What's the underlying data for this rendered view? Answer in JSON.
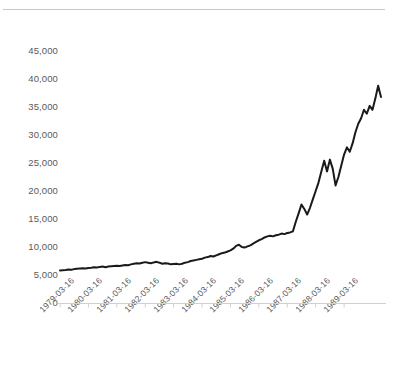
{
  "chart_data": {
    "type": "line",
    "title": "",
    "subtitle": "",
    "xlabel": "",
    "ylabel": "",
    "grid": false,
    "legend": false,
    "legend_position": "none",
    "line_color": "#1a1a1a",
    "axis_color": "#d0d0d0",
    "label_color": "#5a5a5a",
    "ylim": [
      0,
      45000
    ],
    "y_ticks": [
      "0",
      "5,000",
      "10,000",
      "15,000",
      "20,000",
      "25,000",
      "30,000",
      "35,000",
      "40,000",
      "45,000"
    ],
    "y_tick_values": [
      0,
      5000,
      10000,
      15000,
      20000,
      25000,
      30000,
      35000,
      40000,
      45000
    ],
    "x_ticks": [
      "1979-03-16",
      "1980-03-16",
      "1981-03-16",
      "1982-03-16",
      "1983-03-16",
      "1984-03-16",
      "1985-03-16",
      "1986-03-16",
      "1987-03-16",
      "1988-03-16",
      "1989-03-16"
    ],
    "xlim": [
      "1979-03-16",
      "1989-09-16"
    ],
    "series": [
      {
        "name": "series-1",
        "x": [
          0.0,
          0.1,
          0.2,
          0.3,
          0.4,
          0.5,
          0.6,
          0.7,
          0.8,
          0.9,
          1.0,
          1.1,
          1.2,
          1.3,
          1.4,
          1.5,
          1.6,
          1.7,
          1.8,
          1.9,
          2.0,
          2.1,
          2.2,
          2.3,
          2.4,
          2.5,
          2.6,
          2.7,
          2.8,
          2.9,
          3.0,
          3.1,
          3.2,
          3.3,
          3.4,
          3.5,
          3.6,
          3.7,
          3.8,
          3.9,
          4.0,
          4.1,
          4.2,
          4.3,
          4.4,
          4.5,
          4.6,
          4.7,
          4.8,
          4.9,
          5.0,
          5.1,
          5.2,
          5.3,
          5.4,
          5.5,
          5.6,
          5.7,
          5.8,
          5.9,
          6.0,
          6.1,
          6.2,
          6.3,
          6.4,
          6.5,
          6.6,
          6.7,
          6.8,
          6.9,
          7.0,
          7.1,
          7.2,
          7.3,
          7.4,
          7.5,
          7.6,
          7.7,
          7.8,
          7.9,
          8.0,
          8.1,
          8.2,
          8.3,
          8.4,
          8.5,
          8.6,
          8.7,
          8.8,
          8.9,
          9.0,
          9.1,
          9.2,
          9.3,
          9.4,
          9.5,
          9.6,
          9.7,
          9.8,
          9.9,
          10.0,
          10.1,
          10.2,
          10.3,
          10.4,
          10.5
        ],
        "values": [
          5800,
          5850,
          5900,
          6000,
          5950,
          6050,
          6100,
          6150,
          6200,
          6150,
          6250,
          6300,
          6400,
          6350,
          6450,
          6500,
          6400,
          6500,
          6550,
          6600,
          6650,
          6600,
          6700,
          6800,
          6750,
          6900,
          7000,
          7100,
          7050,
          7200,
          7300,
          7200,
          7100,
          7250,
          7350,
          7200,
          7000,
          7100,
          7050,
          6900,
          6950,
          7000,
          6900,
          7000,
          7200,
          7300,
          7500,
          7600,
          7700,
          7800,
          7900,
          8100,
          8200,
          8400,
          8300,
          8500,
          8700,
          8900,
          9000,
          9200,
          9400,
          9700,
          10200,
          10400,
          10000,
          9900,
          10100,
          10300,
          10600,
          10900,
          11200,
          11400,
          11700,
          11900,
          12000,
          11900,
          12100,
          12200,
          12400,
          12300,
          12500,
          12600,
          12800,
          14500,
          16000,
          17600,
          16800,
          15800,
          17000,
          18500,
          20000,
          21500,
          23500,
          25400,
          23500,
          25600,
          24000,
          21000,
          22500,
          24500,
          26500,
          27800,
          27000,
          28500,
          30500,
          32000
        ]
      }
    ],
    "series_extra": {
      "tail_x": [
        10.6,
        10.7,
        10.8,
        10.9,
        11.0,
        11.1,
        11.2,
        11.3
      ],
      "tail_values": [
        33000,
        34500,
        33800,
        35200,
        34500,
        36500,
        38800,
        36800
      ]
    }
  }
}
